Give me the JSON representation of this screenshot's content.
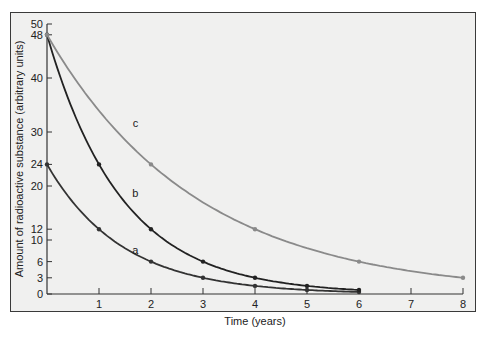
{
  "chart_data": {
    "type": "line",
    "title": "",
    "xlabel": "Time (years)",
    "ylabel": "Amount of radioactive substance (arbitrary units)",
    "xlim": [
      0,
      8
    ],
    "ylim": [
      0,
      50
    ],
    "x_ticks": [
      1,
      2,
      3,
      4,
      5,
      6,
      7,
      8
    ],
    "y_ticks": [
      0,
      3,
      6,
      10,
      12,
      20,
      24,
      30,
      40,
      48,
      50
    ],
    "grid": false,
    "legend": "none (curves labeled inline a, b, c)",
    "series": [
      {
        "name": "a",
        "color": "#333333",
        "x": [
          0,
          1,
          2,
          3,
          4,
          5,
          6
        ],
        "values": [
          24,
          12,
          6,
          3,
          1.5,
          0.75,
          0.375
        ],
        "label_pos": [
          1.7,
          7.5
        ]
      },
      {
        "name": "b",
        "color": "#222222",
        "x": [
          0,
          1,
          2,
          3,
          4,
          5,
          6
        ],
        "values": [
          48,
          24,
          12,
          6,
          3,
          1.5,
          0.75
        ],
        "label_pos": [
          1.7,
          18
        ]
      },
      {
        "name": "c",
        "color": "#8a8a8a",
        "x": [
          0,
          2,
          4,
          6,
          8
        ],
        "values": [
          48,
          24,
          12,
          6,
          3
        ],
        "label_pos": [
          1.7,
          31
        ]
      }
    ]
  }
}
